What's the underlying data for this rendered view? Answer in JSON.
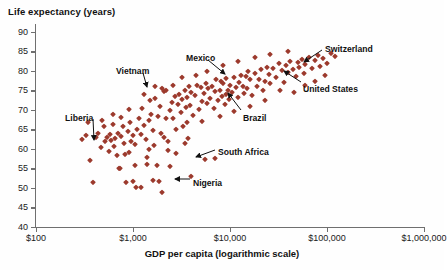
{
  "chart_data": {
    "type": "scatter",
    "title": "",
    "ylabel": "Life expectancy (years)",
    "xlabel": "GDP per capita (logarithmic scale)",
    "xscale": "log",
    "xlim": [
      100,
      1000000
    ],
    "ylim": [
      40,
      92
    ],
    "grid": false,
    "legend": "none",
    "marker_color": "#9c3a2d",
    "marker_shape": "diamond",
    "xticks": [
      {
        "value": 100,
        "label": "$100"
      },
      {
        "value": 1000,
        "label": "$1,000"
      },
      {
        "value": 10000,
        "label": "$10,000"
      },
      {
        "value": 100000,
        "label": "$100,000"
      },
      {
        "value": 1000000,
        "label": "$1,000,000"
      }
    ],
    "yticks": [
      {
        "value": 90,
        "label": "90"
      },
      {
        "value": 85,
        "label": "85"
      },
      {
        "value": 80,
        "label": "80"
      },
      {
        "value": 75,
        "label": "75"
      },
      {
        "value": 70,
        "label": "70"
      },
      {
        "value": 65,
        "label": "65"
      },
      {
        "value": 60,
        "label": "60"
      },
      {
        "value": 55,
        "label": "55"
      },
      {
        "value": 50,
        "label": "50"
      },
      {
        "value": 45,
        "label": "45"
      },
      {
        "value": 40,
        "label": "40"
      }
    ],
    "annotations": [
      {
        "label": "Liberia",
        "lx": 65,
        "ly": 113,
        "ax1": 93,
        "ay1": 119,
        "ax2": 94,
        "ay2": 140
      },
      {
        "label": "Vietnam",
        "lx": 116,
        "ly": 66,
        "ax1": 143,
        "ay1": 73,
        "ax2": 147,
        "ay2": 87
      },
      {
        "label": "Mexico",
        "lx": 186,
        "ly": 53,
        "ax1": 208,
        "ay1": 60,
        "ax2": 225,
        "ay2": 74
      },
      {
        "label": "Brazil",
        "lx": 243,
        "ly": 113,
        "ax1": 241,
        "ay1": 110,
        "ax2": 228,
        "ay2": 93
      },
      {
        "label": "Switzerland",
        "lx": 325,
        "ly": 44,
        "ax1": 322,
        "ay1": 50,
        "ax2": 304,
        "ay2": 62
      },
      {
        "label": "United States",
        "lx": 303,
        "ly": 84,
        "ax1": 301,
        "ay1": 82,
        "ax2": 284,
        "ay2": 71
      },
      {
        "label": "South Africa",
        "lx": 218,
        "ly": 147,
        "ax1": 215,
        "ay1": 150,
        "ax2": 196,
        "ay2": 157
      },
      {
        "label": "Nigeria",
        "lx": 193,
        "ly": 178,
        "ax1": 190,
        "ay1": 179,
        "ax2": 175,
        "ay2": 179
      }
    ],
    "points": [
      {
        "x": 300,
        "y": 62.5
      },
      {
        "x": 330,
        "y": 63.5
      },
      {
        "x": 360,
        "y": 57.2
      },
      {
        "x": 390,
        "y": 51.5
      },
      {
        "x": 420,
        "y": 63.0
      },
      {
        "x": 440,
        "y": 64.2
      },
      {
        "x": 470,
        "y": 60.5
      },
      {
        "x": 500,
        "y": 65.8
      },
      {
        "x": 520,
        "y": 62.0
      },
      {
        "x": 540,
        "y": 63.0
      },
      {
        "x": 560,
        "y": 59.5
      },
      {
        "x": 580,
        "y": 63.8
      },
      {
        "x": 600,
        "y": 62.2
      },
      {
        "x": 620,
        "y": 66.5
      },
      {
        "x": 640,
        "y": 60.8
      },
      {
        "x": 660,
        "y": 62.8
      },
      {
        "x": 680,
        "y": 58.5
      },
      {
        "x": 700,
        "y": 64.0
      },
      {
        "x": 720,
        "y": 55.2
      },
      {
        "x": 740,
        "y": 55.0
      },
      {
        "x": 760,
        "y": 63.2
      },
      {
        "x": 780,
        "y": 66.0
      },
      {
        "x": 800,
        "y": 61.5
      },
      {
        "x": 820,
        "y": 58.8
      },
      {
        "x": 850,
        "y": 51.5
      },
      {
        "x": 880,
        "y": 64.5
      },
      {
        "x": 900,
        "y": 59.2
      },
      {
        "x": 930,
        "y": 67.0
      },
      {
        "x": 960,
        "y": 62.0
      },
      {
        "x": 990,
        "y": 63.5
      },
      {
        "x": 1000,
        "y": 51.8
      },
      {
        "x": 1050,
        "y": 56.0
      },
      {
        "x": 1080,
        "y": 50.2
      },
      {
        "x": 1100,
        "y": 65.2
      },
      {
        "x": 1150,
        "y": 68.0
      },
      {
        "x": 1200,
        "y": 63.8
      },
      {
        "x": 1250,
        "y": 70.5
      },
      {
        "x": 1300,
        "y": 66.2
      },
      {
        "x": 1350,
        "y": 62.5
      },
      {
        "x": 1400,
        "y": 56.2
      },
      {
        "x": 1450,
        "y": 67.5
      },
      {
        "x": 1500,
        "y": 72.5
      },
      {
        "x": 1550,
        "y": 69.0
      },
      {
        "x": 1600,
        "y": 64.8
      },
      {
        "x": 1650,
        "y": 61.0
      },
      {
        "x": 1700,
        "y": 73.0
      },
      {
        "x": 1750,
        "y": 55.8
      },
      {
        "x": 1800,
        "y": 68.5
      },
      {
        "x": 1850,
        "y": 51.8
      },
      {
        "x": 1900,
        "y": 71.0
      },
      {
        "x": 1950,
        "y": 64.0
      },
      {
        "x": 2000,
        "y": 75.5
      },
      {
        "x": 2100,
        "y": 74.8
      },
      {
        "x": 2200,
        "y": 75.2
      },
      {
        "x": 2300,
        "y": 62.0
      },
      {
        "x": 2400,
        "y": 70.0
      },
      {
        "x": 2500,
        "y": 72.0
      },
      {
        "x": 2600,
        "y": 67.8
      },
      {
        "x": 2700,
        "y": 73.5
      },
      {
        "x": 2800,
        "y": 59.0
      },
      {
        "x": 2900,
        "y": 71.5
      },
      {
        "x": 3000,
        "y": 74.0
      },
      {
        "x": 3100,
        "y": 69.5
      },
      {
        "x": 3200,
        "y": 72.8
      },
      {
        "x": 3300,
        "y": 66.0
      },
      {
        "x": 3400,
        "y": 75.0
      },
      {
        "x": 3500,
        "y": 70.8
      },
      {
        "x": 3600,
        "y": 73.2
      },
      {
        "x": 3700,
        "y": 62.8
      },
      {
        "x": 3800,
        "y": 76.0
      },
      {
        "x": 3900,
        "y": 71.2
      },
      {
        "x": 4000,
        "y": 74.5
      },
      {
        "x": 4200,
        "y": 68.8
      },
      {
        "x": 4400,
        "y": 73.8
      },
      {
        "x": 4600,
        "y": 76.5
      },
      {
        "x": 4800,
        "y": 70.2
      },
      {
        "x": 5000,
        "y": 75.8
      },
      {
        "x": 5200,
        "y": 72.2
      },
      {
        "x": 5400,
        "y": 74.2
      },
      {
        "x": 5600,
        "y": 77.0
      },
      {
        "x": 5800,
        "y": 71.8
      },
      {
        "x": 6000,
        "y": 75.5
      },
      {
        "x": 6200,
        "y": 73.0
      },
      {
        "x": 6500,
        "y": 76.2
      },
      {
        "x": 6800,
        "y": 70.5
      },
      {
        "x": 7000,
        "y": 74.8
      },
      {
        "x": 7200,
        "y": 78.0
      },
      {
        "x": 7500,
        "y": 72.5
      },
      {
        "x": 7800,
        "y": 75.2
      },
      {
        "x": 8000,
        "y": 77.5
      },
      {
        "x": 8200,
        "y": 73.5
      },
      {
        "x": 8500,
        "y": 76.8
      },
      {
        "x": 8800,
        "y": 71.5
      },
      {
        "x": 9000,
        "y": 74.0
      },
      {
        "x": 9200,
        "y": 78.2
      },
      {
        "x": 9500,
        "y": 75.0
      },
      {
        "x": 9800,
        "y": 72.8
      },
      {
        "x": 10000,
        "y": 76.5
      },
      {
        "x": 10500,
        "y": 74.5
      },
      {
        "x": 11000,
        "y": 78.5
      },
      {
        "x": 11500,
        "y": 75.8
      },
      {
        "x": 12000,
        "y": 73.2
      },
      {
        "x": 12500,
        "y": 77.2
      },
      {
        "x": 13000,
        "y": 79.0
      },
      {
        "x": 13500,
        "y": 76.0
      },
      {
        "x": 14000,
        "y": 74.2
      },
      {
        "x": 14500,
        "y": 78.8
      },
      {
        "x": 15000,
        "y": 75.5
      },
      {
        "x": 15500,
        "y": 80.0
      },
      {
        "x": 16000,
        "y": 77.8
      },
      {
        "x": 17000,
        "y": 73.8
      },
      {
        "x": 18000,
        "y": 79.5
      },
      {
        "x": 19000,
        "y": 76.2
      },
      {
        "x": 20000,
        "y": 78.0
      },
      {
        "x": 21000,
        "y": 80.5
      },
      {
        "x": 22000,
        "y": 75.0
      },
      {
        "x": 23000,
        "y": 77.5
      },
      {
        "x": 24000,
        "y": 81.0
      },
      {
        "x": 25000,
        "y": 79.2
      },
      {
        "x": 26000,
        "y": 76.8
      },
      {
        "x": 28000,
        "y": 80.8
      },
      {
        "x": 30000,
        "y": 78.5
      },
      {
        "x": 32000,
        "y": 82.0
      },
      {
        "x": 34000,
        "y": 80.2
      },
      {
        "x": 36000,
        "y": 77.2
      },
      {
        "x": 38000,
        "y": 81.5
      },
      {
        "x": 40000,
        "y": 79.8
      },
      {
        "x": 42000,
        "y": 82.5
      },
      {
        "x": 45000,
        "y": 80.5
      },
      {
        "x": 48000,
        "y": 78.8
      },
      {
        "x": 50000,
        "y": 82.2
      },
      {
        "x": 52000,
        "y": 81.0
      },
      {
        "x": 55000,
        "y": 83.0
      },
      {
        "x": 58000,
        "y": 79.5
      },
      {
        "x": 60000,
        "y": 81.8
      },
      {
        "x": 65000,
        "y": 83.5
      },
      {
        "x": 70000,
        "y": 80.8
      },
      {
        "x": 75000,
        "y": 82.8
      },
      {
        "x": 80000,
        "y": 84.0
      },
      {
        "x": 85000,
        "y": 81.2
      },
      {
        "x": 90000,
        "y": 83.2
      },
      {
        "x": 100000,
        "y": 82.0
      },
      {
        "x": 110000,
        "y": 84.5
      },
      {
        "x": 120000,
        "y": 83.8
      },
      {
        "x": 2000,
        "y": 49.0
      },
      {
        "x": 4000,
        "y": 53.0
      },
      {
        "x": 5500,
        "y": 57.5
      },
      {
        "x": 7000,
        "y": 57.8
      },
      {
        "x": 1200,
        "y": 50.2
      },
      {
        "x": 1600,
        "y": 52.0
      },
      {
        "x": 2400,
        "y": 55.5
      },
      {
        "x": 340,
        "y": 66.8
      },
      {
        "x": 480,
        "y": 67.5
      },
      {
        "x": 760,
        "y": 68.2
      },
      {
        "x": 1050,
        "y": 61.2
      },
      {
        "x": 1450,
        "y": 60.0
      },
      {
        "x": 2100,
        "y": 63.0
      },
      {
        "x": 2800,
        "y": 65.0
      },
      {
        "x": 3600,
        "y": 66.8
      },
      {
        "x": 620,
        "y": 69.0
      },
      {
        "x": 900,
        "y": 70.2
      },
      {
        "x": 1300,
        "y": 74.0
      },
      {
        "x": 1700,
        "y": 76.2
      },
      {
        "x": 2200,
        "y": 68.0
      },
      {
        "x": 2600,
        "y": 76.5
      },
      {
        "x": 3200,
        "y": 78.5
      },
      {
        "x": 4500,
        "y": 79.0
      },
      {
        "x": 5800,
        "y": 80.0
      },
      {
        "x": 8500,
        "y": 81.5
      },
      {
        "x": 12000,
        "y": 82.5
      },
      {
        "x": 18000,
        "y": 83.5
      },
      {
        "x": 26000,
        "y": 84.2
      },
      {
        "x": 40000,
        "y": 85.0
      },
      {
        "x": 60000,
        "y": 76.5
      },
      {
        "x": 75000,
        "y": 77.5
      },
      {
        "x": 95000,
        "y": 79.0
      },
      {
        "x": 46000,
        "y": 74.5
      },
      {
        "x": 33000,
        "y": 75.2
      },
      {
        "x": 23000,
        "y": 72.5
      },
      {
        "x": 16000,
        "y": 71.0
      },
      {
        "x": 11000,
        "y": 69.8
      },
      {
        "x": 7800,
        "y": 68.5
      },
      {
        "x": 5200,
        "y": 67.2
      },
      {
        "x": 3400,
        "y": 61.5
      },
      {
        "x": 2300,
        "y": 59.8
      },
      {
        "x": 1400,
        "y": 58.0
      }
    ]
  }
}
